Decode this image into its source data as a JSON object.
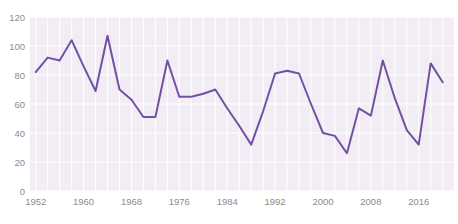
{
  "chart_data": {
    "type": "line",
    "x": [
      1952,
      1954,
      1956,
      1958,
      1960,
      1962,
      1964,
      1966,
      1968,
      1970,
      1972,
      1974,
      1976,
      1978,
      1980,
      1982,
      1984,
      1986,
      1988,
      1990,
      1992,
      1994,
      1996,
      1998,
      2000,
      2002,
      2004,
      2006,
      2008,
      2010,
      2012,
      2014,
      2016,
      2018,
      2020
    ],
    "values": [
      82,
      92,
      90,
      104,
      86,
      69,
      107,
      70,
      63,
      51,
      51,
      90,
      65,
      65,
      67,
      70,
      57,
      45,
      32,
      55,
      81,
      83,
      81,
      60,
      40,
      38,
      26,
      57,
      52,
      90,
      64,
      42,
      32,
      88,
      75
    ],
    "ylim": [
      0,
      120
    ],
    "y_ticks": [
      0,
      20,
      40,
      60,
      80,
      100,
      120
    ],
    "x_tick_years": [
      1952,
      1960,
      1968,
      1976,
      1984,
      1992,
      2000,
      2008,
      2016
    ],
    "x_tick_labels": [
      "1952",
      "1960",
      "1968",
      "1976",
      "1984",
      "1992",
      "2000",
      "2008",
      "2016"
    ],
    "grid": true,
    "legend": "none",
    "colors": {
      "line": "#7450a4",
      "plot_background": "#f2edf5",
      "grid": "#ffffff",
      "tick_label": "#8c8c8c"
    }
  }
}
